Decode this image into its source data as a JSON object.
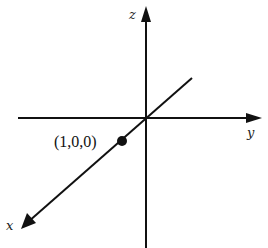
{
  "diagram": {
    "type": "3d-coordinate-axes",
    "background": "#ffffff",
    "stroke_color": "#111111",
    "axes": {
      "z": {
        "label": "z"
      },
      "y": {
        "label": "y"
      },
      "x": {
        "label": "x"
      }
    },
    "point": {
      "label": "(1,0,0)",
      "coordinates": [
        1,
        0,
        0
      ]
    }
  }
}
